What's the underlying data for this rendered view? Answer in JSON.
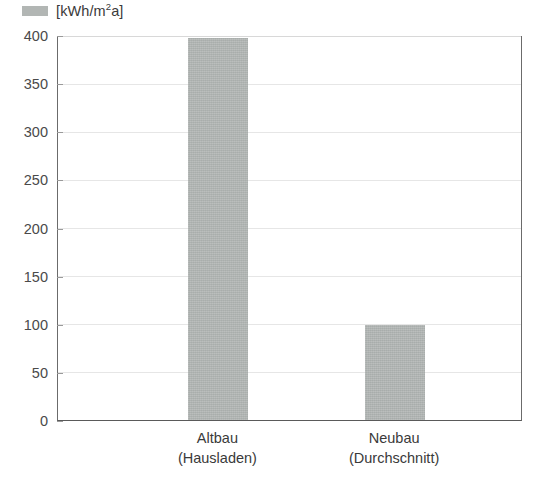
{
  "legend": {
    "swatch_name": "series-swatch",
    "unit_prefix": "[kWh/m",
    "unit_sup": "2",
    "unit_suffix": "a]",
    "full_label": "[kWh/m2a]",
    "color": "#b2b6b4"
  },
  "chart_data": {
    "type": "bar",
    "title": "",
    "subtitle": "",
    "xlabel": "",
    "ylabel": "[kWh/m2a]",
    "categories": [
      "Altbau (Hausladen)",
      "Neubau (Durchschnitt)"
    ],
    "category_lines": [
      [
        "Altbau",
        "(Hausladen)"
      ],
      [
        "Neubau",
        "(Durchschnitt)"
      ]
    ],
    "values": [
      397,
      99
    ],
    "series": [
      {
        "name": "[kWh/m2a]",
        "values": [
          397,
          99
        ],
        "color": "#aeb3b1"
      }
    ],
    "ylim": [
      0,
      400
    ],
    "ytick_step": 50,
    "yticks": [
      0,
      50,
      100,
      150,
      200,
      250,
      300,
      350,
      400
    ],
    "ytick_labels": [
      "0",
      "50",
      "100",
      "150",
      "200",
      "250",
      "300",
      "350",
      "400"
    ],
    "grid": true,
    "grid_axis": "y",
    "legend_position": "top-left",
    "bar_color": "#aeb3b1",
    "axis_color": "#6b6b6b",
    "grid_color": "#e6e6e6",
    "background": "#ffffff"
  }
}
